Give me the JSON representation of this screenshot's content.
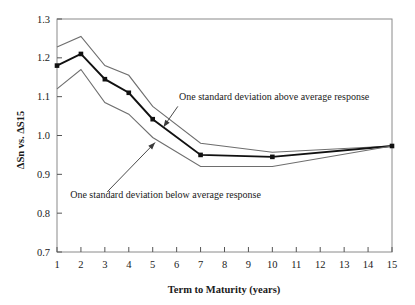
{
  "chart_data": {
    "type": "line",
    "title": "",
    "xlabel": "Term to Maturity (years)",
    "ylabel": "ΔSn vs. ΔS15",
    "xlim": [
      1,
      15
    ],
    "ylim": [
      0.7,
      1.3
    ],
    "grid": false,
    "legend_position": "none",
    "x": [
      1,
      2,
      3,
      4,
      5,
      7,
      10,
      15
    ],
    "xticks": [
      1,
      2,
      3,
      4,
      5,
      6,
      7,
      8,
      9,
      10,
      11,
      12,
      13,
      14,
      15
    ],
    "xtick_labels": [
      "1",
      "2",
      "3",
      "4",
      "5",
      "6",
      "7",
      "8",
      "9",
      "10",
      "11",
      "12",
      "13",
      "14",
      "15"
    ],
    "yticks": [
      0.7,
      0.8,
      0.9,
      1.0,
      1.1,
      1.2,
      1.3
    ],
    "ytick_labels": [
      "0.7",
      "0.8",
      "0.9",
      "1.0",
      "1.1",
      "1.2",
      "1.3"
    ],
    "series": [
      {
        "name": "One standard deviation above average response",
        "values": [
          1.228,
          1.255,
          1.18,
          1.155,
          1.075,
          0.98,
          0.957,
          0.973
        ],
        "style": "thin",
        "markers": false
      },
      {
        "name": "Average response",
        "values": [
          1.18,
          1.21,
          1.145,
          1.11,
          1.042,
          0.95,
          0.945,
          0.973
        ],
        "style": "thick",
        "markers": true
      },
      {
        "name": "One standard deviation below average response",
        "values": [
          1.12,
          1.17,
          1.085,
          1.055,
          0.995,
          0.92,
          0.92,
          0.973
        ],
        "style": "thin",
        "markers": false
      }
    ],
    "annotations": [
      {
        "text": "One standard deviation above average response",
        "text_x": 6.1,
        "text_y": 1.092,
        "arrow_from_x": 6.05,
        "arrow_from_y": 1.075,
        "arrow_to_x": 5.45,
        "arrow_to_y": 1.022
      },
      {
        "text": "One standard deviation below average response",
        "text_x": 1.55,
        "text_y": 0.838,
        "arrow_from_x": 3.1,
        "arrow_from_y": 0.855,
        "arrow_to_x": 5.1,
        "arrow_to_y": 0.982
      }
    ],
    "colors": {
      "mean_line": "#111111",
      "band_line": "#6e6e6e",
      "frame": "#8a8a8a",
      "text": "#1a1a1a",
      "background": "#ffffff"
    }
  }
}
